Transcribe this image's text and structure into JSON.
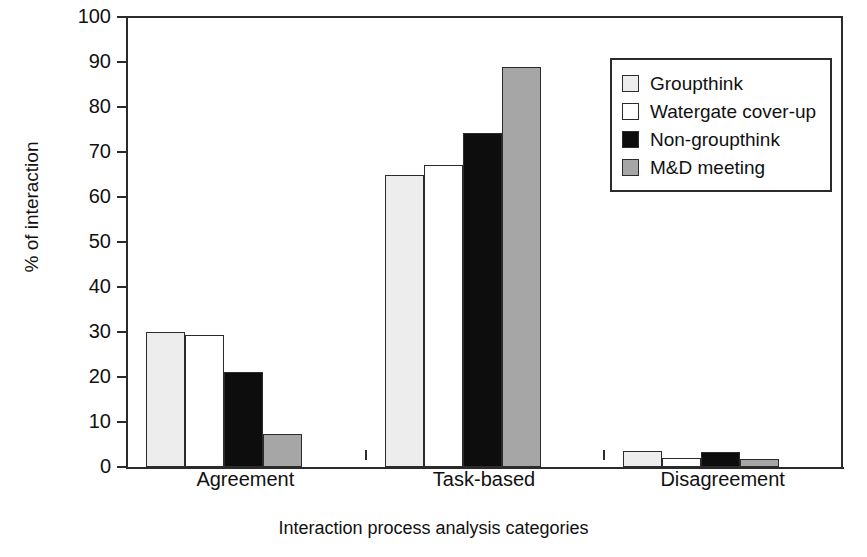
{
  "chart_data": {
    "type": "bar",
    "title": "",
    "subtitle": "",
    "xlabel": "Interaction process analysis categories",
    "ylabel": "% of interaction",
    "ylim": [
      0,
      100
    ],
    "ytick_step": 10,
    "yticks": [
      0,
      10,
      20,
      30,
      40,
      50,
      60,
      70,
      80,
      90,
      100
    ],
    "grid": false,
    "legend_position": "top-right",
    "categories": [
      "Agreement",
      "Task-based",
      "Disagreement"
    ],
    "series": [
      {
        "name": "Groupthink",
        "color": "#ededed",
        "values": [
          30.0,
          65.0,
          3.5
        ]
      },
      {
        "name": "Watergate cover-up",
        "color": "#ffffff",
        "values": [
          29.3,
          67.2,
          2.0
        ]
      },
      {
        "name": "Non-groupthink",
        "color": "#0d0d0d",
        "values": [
          21.2,
          74.2,
          3.3
        ]
      },
      {
        "name": "M&D meeting",
        "color": "#a6a6a6",
        "values": [
          7.4,
          89.0,
          1.8
        ]
      }
    ]
  },
  "axis": {
    "y_title": "% of interaction",
    "x_title": "Interaction process analysis categories",
    "tick_labels": [
      "100",
      "90",
      "80",
      "70",
      "60",
      "50",
      "40",
      "30",
      "20",
      "10",
      "0"
    ],
    "category_labels": [
      "Agreement",
      "Task-based",
      "Disagreement"
    ]
  },
  "legend": {
    "items": [
      {
        "label": "Groupthink"
      },
      {
        "label": "Watergate cover-up"
      },
      {
        "label": "Non-groupthink"
      },
      {
        "label": "M&D meeting"
      }
    ]
  },
  "colors": {
    "axis": "#2b2b2b",
    "text": "#111111",
    "series_1": "#ededed",
    "series_2": "#ffffff",
    "series_3": "#0d0d0d",
    "series_4": "#a6a6a6"
  }
}
